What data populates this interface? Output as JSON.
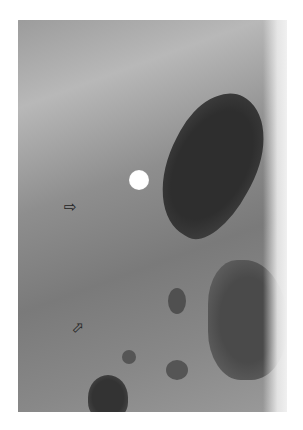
{
  "image": {
    "kind": "radiograph",
    "tone": "grayscale",
    "background_color": "#ffffff",
    "annotations": [
      {
        "type": "open-arrow",
        "direction": "right",
        "symbol": "⇨"
      },
      {
        "type": "open-arrow",
        "direction": "up-right",
        "symbol": "⇨"
      }
    ],
    "marker": {
      "shape": "circle",
      "color": "#ffffff"
    }
  }
}
